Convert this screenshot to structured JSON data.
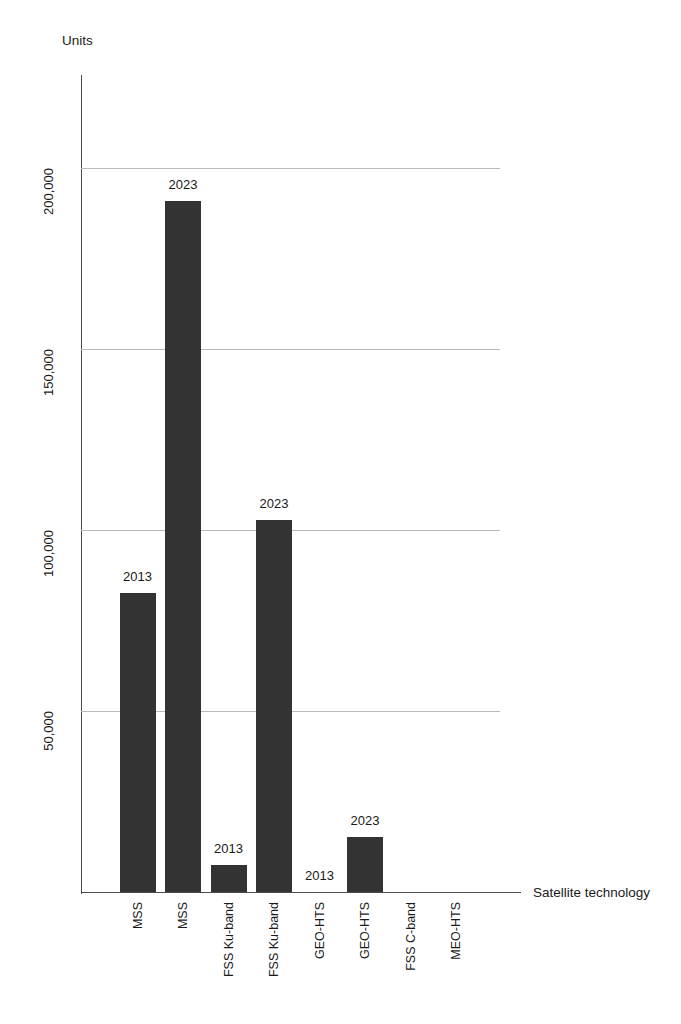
{
  "chart_data": {
    "type": "bar",
    "title": "",
    "subtitle": "",
    "xlabel": "Satellite technology",
    "ylabel": "Units",
    "categories": [
      "MSS",
      "MSS",
      "FSS Ku-band",
      "FSS Ku-band",
      "GEO-HTS",
      "GEO-HTS",
      "FSS C-band",
      "MEO-HTS"
    ],
    "point_labels": [
      "2013",
      "2023",
      "2013",
      "2023",
      "2013",
      "2023",
      "",
      ""
    ],
    "values": [
      82600,
      191000,
      7500,
      102700,
      0,
      15200,
      0,
      0
    ],
    "ylim": [
      0,
      240000
    ],
    "yticks": [
      50000,
      100000,
      150000,
      200000
    ],
    "ytick_labels": [
      "50,000",
      "100,000",
      "150,000",
      "200,000"
    ],
    "grid": true,
    "legend": "none",
    "bar_color": "#333333",
    "gridline_color": "#b9b9b9",
    "axis_color": "#4a4a4a"
  },
  "axes": {
    "y_title": "Units",
    "x_title": "Satellite technology"
  }
}
